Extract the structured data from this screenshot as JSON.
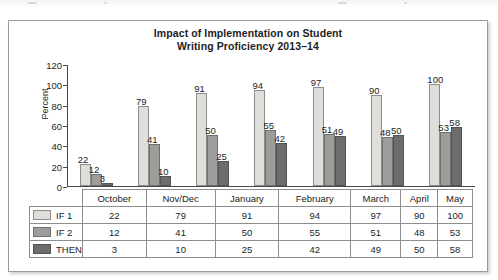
{
  "chart_data": {
    "type": "bar",
    "title": "Impact of Implementation on Student Writing Proficiency 2013–14",
    "title_line1": "Impact of Implementation on Student",
    "title_line2": "Writing Proficiency 2013–14",
    "xlabel": "",
    "ylabel": "Percent",
    "ylim": [
      0,
      120
    ],
    "yticks": [
      0,
      20,
      40,
      60,
      80,
      100,
      120
    ],
    "grid": false,
    "legend_position": "table-row-labels",
    "categories": [
      "October",
      "Nov/Dec",
      "January",
      "February",
      "March",
      "April",
      "May"
    ],
    "series": [
      {
        "name": "IF 1",
        "color": "#dededa",
        "values": [
          22,
          79,
          91,
          94,
          97,
          90,
          100
        ]
      },
      {
        "name": "IF 2",
        "color": "#9d9d9b",
        "values": [
          12,
          41,
          50,
          55,
          51,
          48,
          53
        ]
      },
      {
        "name": "THEN",
        "color": "#6d6d6d",
        "values": [
          3,
          10,
          25,
          42,
          49,
          50,
          58
        ]
      }
    ]
  },
  "table": {
    "column_headers": [
      "October",
      "Nov/Dec",
      "January",
      "February",
      "March",
      "April",
      "May"
    ],
    "rows": [
      {
        "label": "IF 1",
        "values": [
          22,
          79,
          91,
          94,
          97,
          90,
          100
        ]
      },
      {
        "label": "IF 2",
        "values": [
          12,
          41,
          50,
          55,
          51,
          48,
          53
        ]
      },
      {
        "label": "THEN",
        "values": [
          3,
          10,
          25,
          42,
          49,
          50,
          58
        ]
      }
    ]
  }
}
